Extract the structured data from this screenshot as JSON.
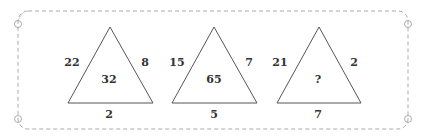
{
  "puzzle": {
    "colors": {
      "stroke": "#555555",
      "border": "#aaaaaa",
      "text": "#333333"
    },
    "triangles": [
      {
        "left": "22",
        "right": "8",
        "bottom": "2",
        "center": "32"
      },
      {
        "left": "15",
        "right": "7",
        "bottom": "5",
        "center": "65"
      },
      {
        "left": "21",
        "right": "2",
        "bottom": "7",
        "center": "?"
      }
    ]
  }
}
